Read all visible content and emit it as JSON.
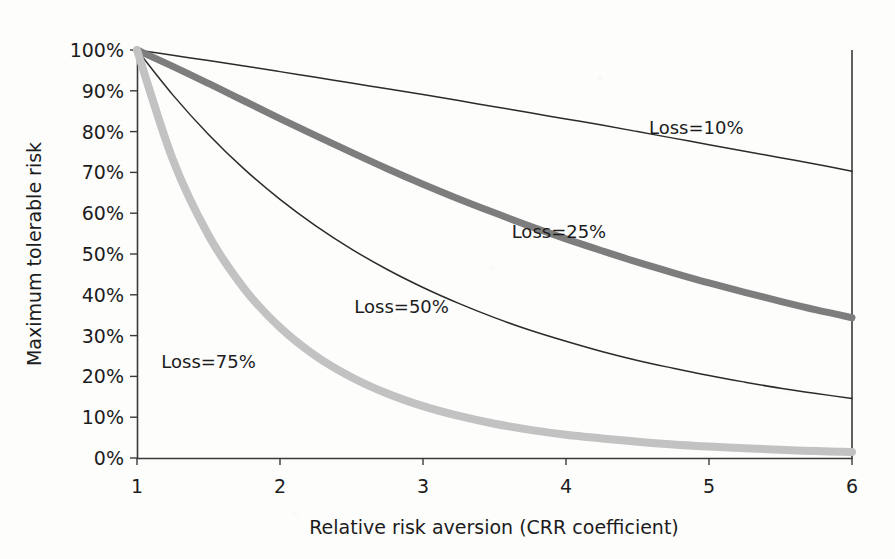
{
  "chart_data": {
    "type": "line",
    "title": "",
    "xlabel": "Relative risk aversion (CRR coefficient)",
    "ylabel": "Maximum tolerable risk",
    "xlim": [
      1,
      6
    ],
    "ylim": [
      0,
      1
    ],
    "grid": false,
    "legend_position": "inline-annotations",
    "x_ticks": [
      "1",
      "2",
      "3",
      "4",
      "5",
      "6"
    ],
    "x_tick_values": [
      1,
      2,
      3,
      4,
      5,
      6
    ],
    "y_ticks": [
      "0%",
      "10%",
      "20%",
      "30%",
      "40%",
      "50%",
      "60%",
      "70%",
      "80%",
      "90%",
      "100%"
    ],
    "y_tick_values": [
      0,
      10,
      20,
      30,
      40,
      50,
      60,
      70,
      80,
      90,
      100
    ],
    "x": [
      1.0,
      1.25,
      1.5,
      1.75,
      2.0,
      2.25,
      2.5,
      2.75,
      3.0,
      3.25,
      3.5,
      3.75,
      4.0,
      4.25,
      4.5,
      4.75,
      5.0,
      5.25,
      5.5,
      5.75,
      6.0
    ],
    "series": [
      {
        "name": "Loss=10%",
        "label": "Loss=10%",
        "loss": 10,
        "color": "#2b2b2b",
        "width": 1.5,
        "style": "thin-dark",
        "values": [
          100.0,
          98.7,
          97.4,
          96.1,
          94.7,
          93.3,
          91.9,
          90.5,
          89.1,
          87.6,
          86.1,
          84.6,
          83.1,
          81.6,
          80.0,
          78.4,
          76.8,
          75.2,
          73.6,
          72.0,
          70.3
        ],
        "label_x": 4.58,
        "label_y": 79.5
      },
      {
        "name": "Loss=25%",
        "label": "Loss=25%",
        "loss": 25,
        "color": "#7d7d7d",
        "width": 7,
        "style": "thick-mid-gray",
        "values": [
          100.0,
          96.0,
          91.8,
          87.5,
          83.2,
          79.0,
          74.9,
          70.9,
          67.1,
          63.5,
          60.1,
          56.8,
          53.7,
          50.8,
          48.0,
          45.4,
          42.9,
          40.6,
          38.4,
          36.3,
          34.4
        ],
        "label_x": 3.62,
        "label_y": 54.0
      },
      {
        "name": "Loss=50%",
        "label": "Loss=50%",
        "loss": 50,
        "color": "#2b2b2b",
        "width": 1.5,
        "style": "thin-dark",
        "values": [
          100.0,
          89.0,
          79.3,
          70.8,
          63.4,
          56.9,
          51.2,
          46.2,
          41.8,
          37.9,
          34.4,
          31.3,
          28.6,
          26.1,
          23.9,
          22.0,
          20.2,
          18.6,
          17.1,
          15.8,
          14.6
        ],
        "label_x": 2.52,
        "label_y": 35.5
      },
      {
        "name": "Loss=75%",
        "label": "Loss=75%",
        "loss": 75,
        "color": "#c2c2c2",
        "width": 8,
        "style": "thick-light-gray",
        "values": [
          100.0,
          73.2,
          54.6,
          41.5,
          32.0,
          25.0,
          19.8,
          15.8,
          12.7,
          10.3,
          8.4,
          6.9,
          5.7,
          4.8,
          4.0,
          3.3,
          2.8,
          2.4,
          2.0,
          1.7,
          1.5
        ],
        "label_x": 1.17,
        "label_y": 22.0
      }
    ]
  },
  "geometry": {
    "plot_left": 137,
    "plot_right": 852,
    "plot_top": 50,
    "plot_bottom": 458
  }
}
